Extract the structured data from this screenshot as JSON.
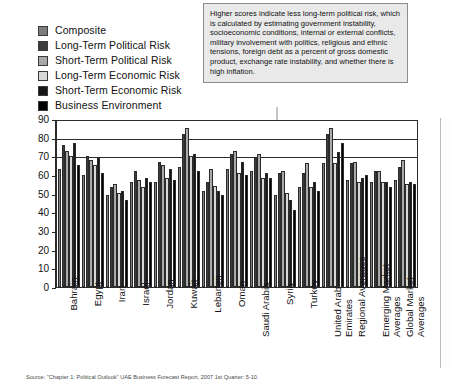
{
  "callout": {
    "text": "Higher scores indicate less long-term political risk, which is calculated by estimating government instability, socioeconomic conditions, internal or external conflicts, military involvement with politics, religious and ethnic tensions, foreign debt as a percent of gross domestic product, exchange rate instability, and whether there is high inflation."
  },
  "source": {
    "text": "Source: \"Chapter 1: Political Outlook\" UAE Business Forecast Report, 2007 1st Quarter: 5-10."
  },
  "legend": {
    "items": [
      {
        "label": "Composite",
        "color": "#7d7d7d"
      },
      {
        "label": "Long-Term Political Risk",
        "color": "#3c3c3c"
      },
      {
        "label": "Short-Term Political Risk",
        "color": "#a9a9a9"
      },
      {
        "label": "Long-Term Economic Risk",
        "color": "#d8d8d8"
      },
      {
        "label": "Short-Term Economic Risk",
        "color": "#171717"
      },
      {
        "label": "Business Environment",
        "color": "#000000"
      }
    ]
  },
  "chart_data": {
    "type": "bar",
    "title": "",
    "xlabel": "",
    "ylabel": "",
    "ylim": [
      0,
      90
    ],
    "yticks": [
      0,
      10,
      20,
      30,
      40,
      50,
      60,
      70,
      80,
      90
    ],
    "grid": true,
    "legend_position": "top-left",
    "categories": [
      "Bahrain",
      "Egypt",
      "Iran",
      "Israel",
      "Jordan",
      "Kuwait",
      "Lebanon",
      "Oman",
      "Saudi Arabia",
      "Syria",
      "Turkey",
      "United Arab Emirates",
      "Regional Averages",
      "Emerging Market Averages",
      "Global Market Averages"
    ],
    "series": [
      {
        "name": "Composite",
        "color": "#7d7d7d",
        "values": [
          64,
          61,
          50,
          57,
          57,
          65,
          52,
          64,
          63,
          50,
          54,
          67,
          58,
          57,
          58
        ]
      },
      {
        "name": "Long-Term Political Risk",
        "color": "#3c3c3c",
        "values": [
          77,
          71,
          54,
          63,
          68,
          83,
          57,
          72,
          70,
          62,
          62,
          83,
          67,
          63,
          65
        ]
      },
      {
        "name": "Short-Term Political Risk",
        "color": "#a9a9a9",
        "values": [
          74,
          69,
          56,
          58,
          66,
          86,
          64,
          74,
          72,
          63,
          67,
          86,
          68,
          63,
          69
        ]
      },
      {
        "name": "Long-Term Economic Risk",
        "color": "#d8d8d8",
        "values": [
          71,
          66,
          51,
          54,
          59,
          71,
          55,
          62,
          59,
          51,
          54,
          67,
          57,
          57,
          56
        ]
      },
      {
        "name": "Short-Term Economic Risk",
        "color": "#171717",
        "values": [
          78,
          70,
          52,
          59,
          64,
          72,
          52,
          68,
          62,
          47,
          57,
          73,
          59,
          57,
          57
        ]
      },
      {
        "name": "Business Environment",
        "color": "#000000",
        "values": [
          66,
          62,
          47,
          57,
          58,
          63,
          50,
          61,
          59,
          42,
          52,
          78,
          61,
          54,
          56
        ]
      }
    ]
  }
}
